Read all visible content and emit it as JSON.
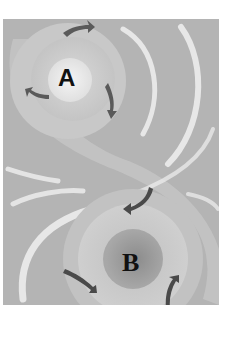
{
  "figure": {
    "systems": [
      {
        "id": "A",
        "label": "A",
        "type": "high-pressure",
        "arrow_direction": "clockwise-outward"
      },
      {
        "id": "B",
        "label": "B",
        "type": "low-pressure",
        "arrow_direction": "counterclockwise-inward"
      }
    ],
    "colors": {
      "background": "#b4b4b4",
      "ring_light": "#d8d8d8",
      "center_a": "#ececec",
      "center_b": "#9a9a9a",
      "arrow": "#555555",
      "cloud": "#f2f2f2"
    }
  }
}
